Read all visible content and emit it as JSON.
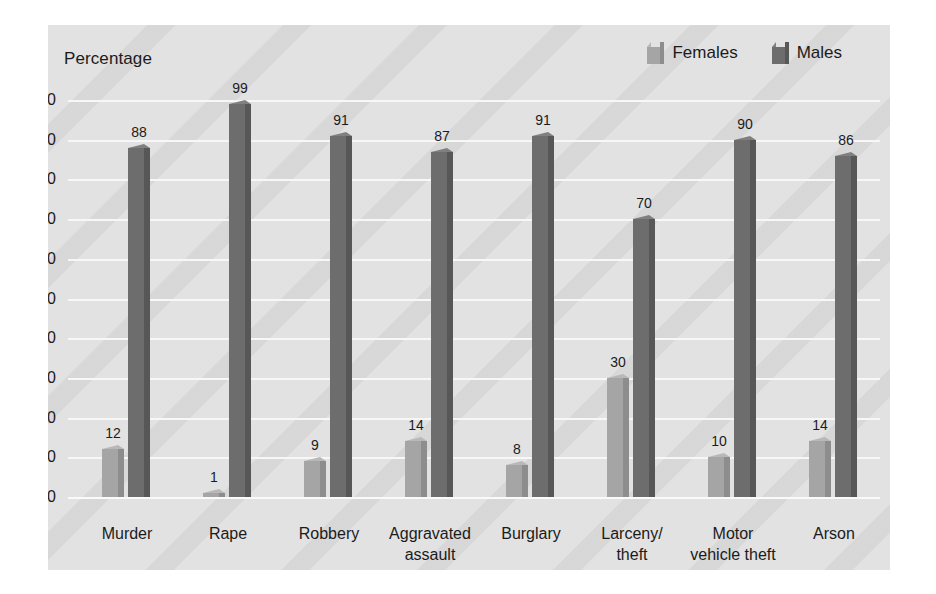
{
  "chart_data": {
    "type": "bar",
    "title": "",
    "ylabel": "Percentage",
    "xlabel": "",
    "ylim": [
      0,
      100
    ],
    "ytick_step": 10,
    "yticks": [
      "100",
      "90",
      "80",
      "70",
      "60",
      "50",
      "40",
      "30",
      "20",
      "10",
      "0"
    ],
    "grid": "horizontal",
    "legend_position": "top-right",
    "categories": [
      "Murder",
      "Rape",
      "Robbery",
      "Aggravated\nassault",
      "Burglary",
      "Larceny/\ntheft",
      "Motor\nvehicle theft",
      "Arson"
    ],
    "category_lines": [
      [
        "Murder"
      ],
      [
        "Rape"
      ],
      [
        "Robbery"
      ],
      [
        "Aggravated",
        "assault"
      ],
      [
        "Burglary"
      ],
      [
        "Larceny/",
        "theft"
      ],
      [
        "Motor",
        "vehicle theft"
      ],
      [
        "Arson"
      ]
    ],
    "series": [
      {
        "name": "Females",
        "color": "#a5a5a5",
        "values": [
          12,
          1,
          9,
          14,
          8,
          30,
          10,
          14
        ]
      },
      {
        "name": "Males",
        "color": "#6d6d6d",
        "values": [
          88,
          99,
          91,
          87,
          91,
          70,
          90,
          86
        ]
      }
    ]
  },
  "legend": {
    "items": [
      {
        "label": "Females",
        "color": "#a5a5a5",
        "icon": "legend-cube-icon"
      },
      {
        "label": "Males",
        "color": "#6d6d6d",
        "icon": "legend-cube-icon"
      }
    ]
  },
  "colors": {
    "panel_background": "#e2e2e2",
    "page_background": "#ffffff",
    "gridline": "#f7f7f7",
    "text": "#1b1b1b",
    "females_front": "#a5a5a5",
    "females_side": "#8d8d8d",
    "females_top": "#b8b8b8",
    "males_front": "#6d6d6d",
    "males_side": "#575757",
    "males_top": "#808080"
  }
}
